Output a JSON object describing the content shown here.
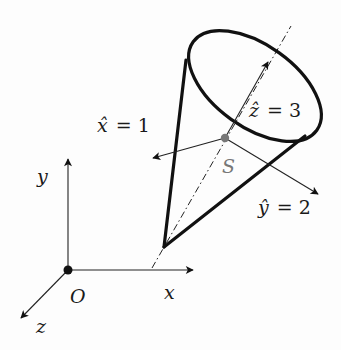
{
  "figure": {
    "world_frame": {
      "origin_label": "O",
      "axes": [
        {
          "name": "x",
          "label": "x"
        },
        {
          "name": "y",
          "label": "y"
        },
        {
          "name": "z",
          "label": "z"
        }
      ]
    },
    "body_frame": {
      "point_label": "S",
      "axes": [
        {
          "name": "x_hat",
          "label_var": "x̂",
          "label_eq": "= 1"
        },
        {
          "name": "y_hat",
          "label_var": "ŷ",
          "label_eq": "= 2"
        },
        {
          "name": "z_hat",
          "label_var": "ẑ",
          "label_eq": "= 3"
        }
      ]
    },
    "colors": {
      "stroke": "#111111",
      "point_S": "#777777",
      "background": "#fdfdfd"
    }
  }
}
